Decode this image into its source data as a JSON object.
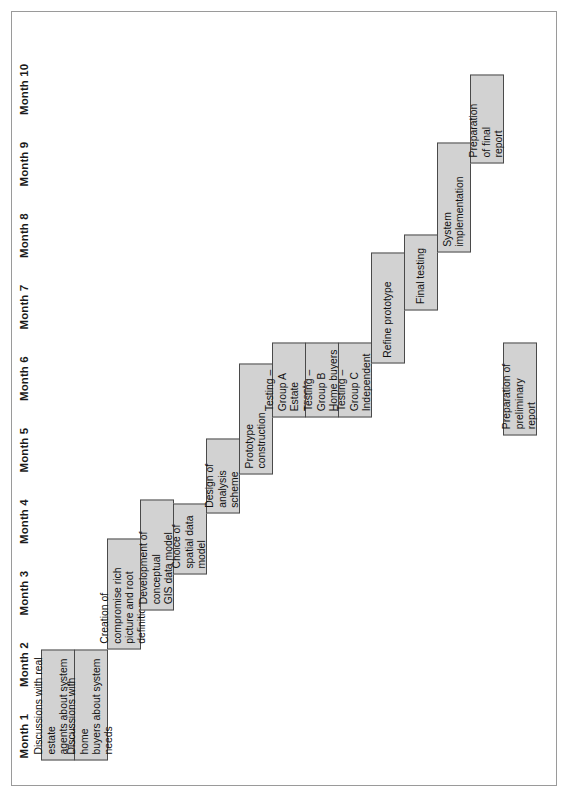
{
  "chart_data": {
    "type": "bar",
    "chart_kind": "gantt",
    "title": "",
    "xlabel": "",
    "ylabel": "",
    "orientation": "rotated-90-ccw",
    "grid": false,
    "legend": false,
    "axis": {
      "name": "month-axis",
      "ticks": [
        "Month 1",
        "Month 2",
        "Month 3",
        "Month 4",
        "Month 5",
        "Month 6",
        "Month 7",
        "Month 8",
        "Month 9",
        "Month 10"
      ],
      "range": [
        1,
        11
      ],
      "units": "months"
    },
    "categories": [
      "Discussions with real estate agents about system needs",
      "Discussions with home buyers about system needs",
      "Creation of compromise rich picture and root definition",
      "Development of conceptual GIS data model",
      "Choice of spatial data model",
      "Design of analysis scheme",
      "Prototype construction",
      "Testing – Group A Estate agents",
      "Testing – Group B Home buyers",
      "Testing – Group C Independent",
      "Refine prototype",
      "Final testing",
      "System implementation",
      "Preparation of final report",
      "Preparation of preliminary report"
    ],
    "tasks": [
      {
        "label": "Discussions with real estate\nagents about system needs",
        "start": 1.0,
        "end": 2.55,
        "duration": 1.55,
        "lane": 0
      },
      {
        "label": "Discussions with home\nbuyers about system needs",
        "start": 1.0,
        "end": 2.55,
        "duration": 1.55,
        "lane": 1
      },
      {
        "label": "Creation of compromise rich\npicture and root definition",
        "start": 2.55,
        "end": 4.1,
        "duration": 1.55,
        "lane": 2
      },
      {
        "label": "Development of conceptual\nGIS data model",
        "start": 3.1,
        "end": 4.65,
        "duration": 1.55,
        "lane": 3
      },
      {
        "label": "Choice of\nspatial data\nmodel",
        "start": 3.6,
        "end": 4.6,
        "duration": 1.0,
        "lane": 4
      },
      {
        "label": "Design of\nanalysis\nscheme",
        "start": 4.45,
        "end": 5.5,
        "duration": 1.05,
        "lane": 5
      },
      {
        "label": "Prototype construction",
        "start": 5.0,
        "end": 6.55,
        "duration": 1.55,
        "lane": 6
      },
      {
        "label": "Testing – Group A\nEstate agents",
        "start": 5.8,
        "end": 6.85,
        "duration": 1.05,
        "lane": 7
      },
      {
        "label": "Testing – Group B\nHome buyers",
        "start": 5.8,
        "end": 6.85,
        "duration": 1.05,
        "lane": 8
      },
      {
        "label": "Testing – Group C\nIndependent",
        "start": 5.8,
        "end": 6.85,
        "duration": 1.05,
        "lane": 9
      },
      {
        "label": "Refine prototype",
        "start": 6.55,
        "end": 8.1,
        "duration": 1.55,
        "lane": 10
      },
      {
        "label": "Final testing",
        "start": 7.3,
        "end": 8.35,
        "duration": 1.05,
        "lane": 11
      },
      {
        "label": "System\nimplementation",
        "start": 8.1,
        "end": 9.65,
        "duration": 1.55,
        "lane": 12
      },
      {
        "label": "Preparation\nof final\nreport",
        "start": 9.35,
        "end": 10.6,
        "duration": 1.25,
        "lane": 13
      },
      {
        "label": "Preparation of\npreliminary\nreport",
        "start": 5.55,
        "end": 6.85,
        "duration": 1.3,
        "lane": 14
      }
    ],
    "colors": {
      "bar_fill": "#d2d2d2",
      "bar_border": "#4a4a4a",
      "text": "#111111",
      "frame": "#9a9a9a",
      "background": "#ffffff"
    }
  }
}
